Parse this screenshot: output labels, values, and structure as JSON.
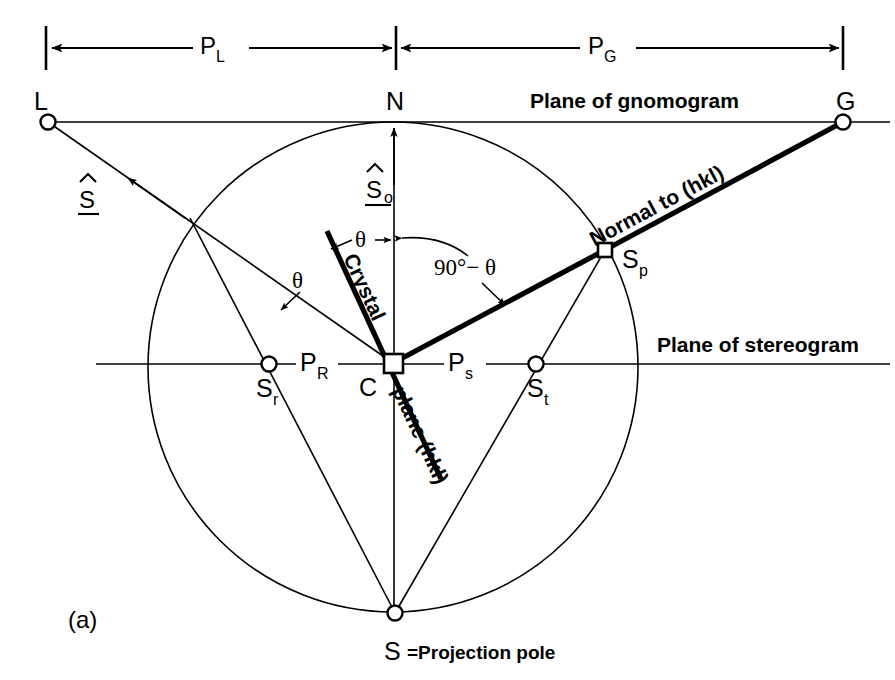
{
  "figure": {
    "panel_label": "(a)",
    "plane_gnomogram_label": "Plane of gnomogram",
    "plane_stereogram_label": "Plane of stereogram",
    "projection_pole_label": "S =Projection pole"
  },
  "dimensions": {
    "left_span_label": "P",
    "left_span_sub": "L",
    "right_span_label": "P",
    "right_span_sub": "G"
  },
  "points": [
    {
      "id": "L",
      "label": "L",
      "sub": "",
      "x": 48,
      "y": 122,
      "marker": "circle"
    },
    {
      "id": "N",
      "label": "N",
      "sub": "",
      "x": 396,
      "y": 122,
      "marker": "none"
    },
    {
      "id": "G",
      "label": "G",
      "sub": "",
      "x": 843,
      "y": 122,
      "marker": "circle"
    },
    {
      "id": "Sp",
      "label": "S",
      "sub": "p",
      "x": 605,
      "y": 250,
      "marker": "square"
    },
    {
      "id": "Sr",
      "label": "S",
      "sub": "r",
      "x": 269,
      "y": 364,
      "marker": "circle"
    },
    {
      "id": "St",
      "label": "S",
      "sub": "t",
      "x": 536,
      "y": 364,
      "marker": "circle"
    },
    {
      "id": "C",
      "label": "C",
      "sub": "",
      "x": 393,
      "y": 363,
      "marker": "square"
    },
    {
      "id": "S",
      "label": "S",
      "sub": "",
      "x": 395,
      "y": 613,
      "marker": "circle"
    }
  ],
  "segment_labels": {
    "PR": {
      "label": "P",
      "sub": "R"
    },
    "PS": {
      "label": "P",
      "sub": "s"
    }
  },
  "vectors": {
    "s_hat": "S",
    "s_hat_zero": "S",
    "s_hat_zero_sub": "o"
  },
  "angles": {
    "theta_left": "θ",
    "theta_mid": "θ",
    "ninety_minus_theta": "90°− θ"
  },
  "rotated_labels": {
    "normal_to_hkl": "Normal to (hkl)",
    "crystal": "Crystal",
    "plane_hkl": "plane (hkl)"
  },
  "colors": {
    "ink": "#000000",
    "paper": "#ffffff"
  },
  "geometry": {
    "circle_cx": 393,
    "circle_cy": 367,
    "circle_r": 245,
    "gnomogram_y": 122,
    "stereogram_y": 364,
    "dim_line_y": 48
  }
}
